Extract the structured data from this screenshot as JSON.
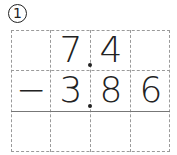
{
  "problem_number": "1",
  "problem": {
    "operator": "−",
    "minuend": [
      "",
      "7",
      "4",
      ""
    ],
    "subtrahend": [
      "",
      "3",
      "8",
      "6"
    ],
    "answer": [
      "",
      "",
      "",
      ""
    ]
  }
}
